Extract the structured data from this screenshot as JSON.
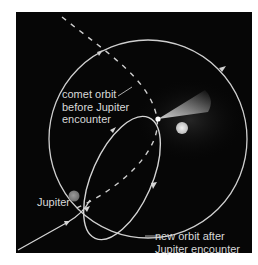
{
  "diagram": {
    "labels": {
      "comet_orbit_before_line1": "comet orbit",
      "comet_orbit_before_line2": "before Jupiter",
      "comet_orbit_before_line3": "encounter",
      "jupiter": "Jupiter",
      "new_orbit_line1": "new orbit after",
      "new_orbit_line2": "Jupiter encounter"
    },
    "elements": [
      {
        "name": "sun",
        "type": "circle",
        "color": "#d9d9d9"
      },
      {
        "name": "jupiter",
        "type": "circle",
        "color": "#8a8a8a"
      },
      {
        "name": "comet",
        "type": "point-with-tail",
        "color": "#ffffff"
      },
      {
        "name": "jupiter-orbit",
        "type": "circle",
        "style": "solid"
      },
      {
        "name": "comet-orbit-before",
        "type": "path",
        "style": "dashed"
      },
      {
        "name": "comet-orbit-after",
        "type": "ellipse",
        "style": "solid"
      },
      {
        "name": "jupiter-approach-path",
        "type": "path",
        "style": "solid"
      }
    ],
    "colors": {
      "background": "#060606",
      "line": "#cfcfcf",
      "text": "#d8d8d8"
    }
  }
}
